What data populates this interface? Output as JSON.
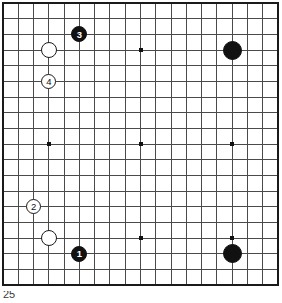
{
  "diagram": {
    "kind": "go-board-diagram",
    "caption": "25",
    "board": {
      "size": 19,
      "line_color": "#4a4a4a",
      "border_color": "#1a1a1a",
      "background_color": "#ffffff",
      "star_point_color": "#111111",
      "star_point_coords": [
        {
          "col": 4,
          "row": 4
        },
        {
          "col": 10,
          "row": 4
        },
        {
          "col": 16,
          "row": 4
        },
        {
          "col": 4,
          "row": 10
        },
        {
          "col": 10,
          "row": 10
        },
        {
          "col": 16,
          "row": 10
        },
        {
          "col": 4,
          "row": 16
        },
        {
          "col": 10,
          "row": 16
        },
        {
          "col": 16,
          "row": 16
        }
      ],
      "geometry": {
        "left": 3,
        "top": 3,
        "width": 275,
        "height": 282,
        "step_x": 15.28,
        "step_y": 15.67
      }
    },
    "stones": [
      {
        "id": "w-unnumbered-upper-left",
        "color": "white",
        "label": "",
        "col": 4,
        "row": 4,
        "radius": 8.0
      },
      {
        "id": "b-move-3",
        "color": "black",
        "label": "3",
        "col": 6,
        "row": 3,
        "radius": 8.0
      },
      {
        "id": "w-move-4",
        "color": "white",
        "label": "4",
        "col": 4,
        "row": 6,
        "radius": 7.5
      },
      {
        "id": "b-unnumbered-upper-right",
        "color": "black",
        "label": "",
        "col": 16,
        "row": 4,
        "radius": 9.5
      },
      {
        "id": "w-move-2",
        "color": "white",
        "label": "2",
        "col": 3,
        "row": 14,
        "radius": 7.5
      },
      {
        "id": "w-unnumbered-lower-left",
        "color": "white",
        "label": "",
        "col": 4,
        "row": 16,
        "radius": 8.0
      },
      {
        "id": "b-move-1",
        "color": "black",
        "label": "1",
        "col": 6,
        "row": 17,
        "radius": 8.0
      },
      {
        "id": "b-unnumbered-lower-right",
        "color": "black",
        "label": "",
        "col": 16,
        "row": 17,
        "radius": 9.5
      }
    ]
  }
}
